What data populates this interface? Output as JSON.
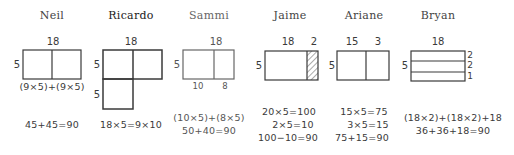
{
  "students": [
    {
      "name": "Neil",
      "top_labels": [
        "18"
      ],
      "side_labels": [
        "5"
      ],
      "bottom_labels": [],
      "right_labels": [],
      "formulas": [
        "(9×5)+(9×5)",
        "45+45=90"
      ]
    },
    {
      "name": "Ricardo",
      "top_labels": [
        "18"
      ],
      "side_labels": [
        "5",
        "5"
      ],
      "bottom_labels": [],
      "right_labels": [],
      "formulas": [
        "18×5=9×10"
      ]
    },
    {
      "name": "Sammi",
      "top_labels": [
        "18"
      ],
      "side_labels": [
        "5"
      ],
      "bottom_labels": [
        "10",
        "8"
      ],
      "right_labels": [],
      "formulas": [
        "(10×5)+(8×5)",
        "50+40=90"
      ]
    },
    {
      "name": "Jaime",
      "top_labels": [
        "18",
        "2"
      ],
      "side_labels": [
        "5"
      ],
      "bottom_labels": [],
      "right_labels": [],
      "formulas": [
        "20×5=100",
        "2×5=10",
        "100−10=90"
      ]
    },
    {
      "name": "Ariane",
      "top_labels": [
        "15",
        "3"
      ],
      "side_labels": [
        "5"
      ],
      "bottom_labels": [],
      "right_labels": [],
      "formulas": [
        "15×5=75",
        "3×5=15",
        "75+15=90"
      ]
    },
    {
      "name": "Bryan",
      "top_labels": [
        "18"
      ],
      "side_labels": [
        "5"
      ],
      "bottom_labels": [],
      "right_labels": [
        "2",
        "2",
        "1"
      ],
      "formulas": [
        "(18×2)+(18×2)+18",
        "36+36+18=90"
      ]
    }
  ],
  "colors": {
    "ink": "#3a3a3a",
    "background": "#ffffff"
  }
}
